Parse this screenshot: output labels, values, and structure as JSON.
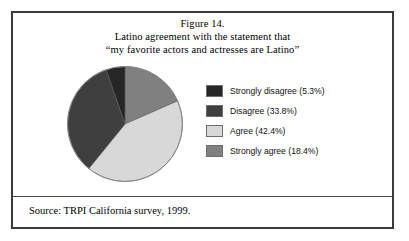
{
  "figure": {
    "title_lines": [
      "Figure 14.",
      "Latino agreement with the statement that",
      "“my favorite actors and actresses are Latino”"
    ],
    "source": "Source: TRPI California survey, 1999."
  },
  "legend": {
    "items": [
      {
        "label": "Strongly disagree (5.3%)",
        "color": "#262626"
      },
      {
        "label": "Disagree (33.8%)",
        "color": "#3f3f3f"
      },
      {
        "label": "Agree (42.4%)",
        "color": "#d8d8d8"
      },
      {
        "label": "Strongly agree (18.4%)",
        "color": "#808080"
      }
    ]
  },
  "chart_data": {
    "type": "pie",
    "title": "Latino agreement with the statement that “my favorite actors and actresses are Latino”",
    "categories": [
      "Strongly disagree",
      "Disagree",
      "Agree",
      "Strongly agree"
    ],
    "values": [
      5.3,
      33.8,
      42.4,
      18.4
    ],
    "value_unit": "percent",
    "labels": [
      "Strongly disagree (5.3%)",
      "Disagree (33.8%)",
      "Agree (42.4%)",
      "Strongly agree (18.4%)"
    ],
    "colors": [
      "#262626",
      "#3f3f3f",
      "#d8d8d8",
      "#808080"
    ],
    "start_angle_deg": 0,
    "direction": "clockwise",
    "draw_order": [
      "Strongly agree",
      "Agree",
      "Disagree",
      "Strongly disagree"
    ],
    "legend": "right",
    "grid": false,
    "source": "Source: TRPI California survey, 1999."
  }
}
